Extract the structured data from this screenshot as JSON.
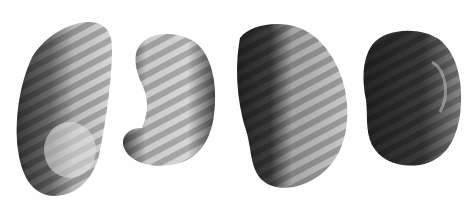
{
  "image": {
    "description": "Grayscale photograph of four kidney-shaped tissue specimens on a white background with diagonal striped illumination",
    "background": "#fefefe",
    "specimens": [
      {
        "name": "specimen-1",
        "tone": "light-to-dark left edge"
      },
      {
        "name": "specimen-2",
        "tone": "light, curved"
      },
      {
        "name": "specimen-3",
        "tone": "dark left half, light right"
      },
      {
        "name": "specimen-4",
        "tone": "dark"
      }
    ]
  }
}
